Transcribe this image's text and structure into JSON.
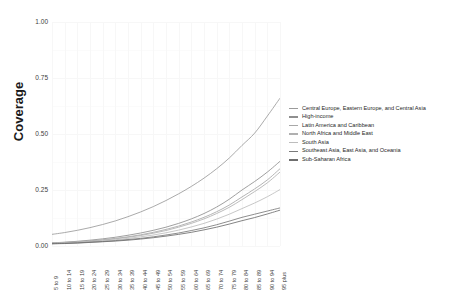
{
  "chart_data": {
    "type": "line",
    "title": "",
    "xlabel": "",
    "ylabel": "Coverage",
    "ylim": [
      0.0,
      1.0
    ],
    "yticks": [
      "1.00",
      "0.75",
      "0.50",
      "0.25",
      "0.00"
    ],
    "ytick_values": [
      1.0,
      0.75,
      0.5,
      0.25,
      0.0
    ],
    "grid": true,
    "legend_position": "right",
    "categories": [
      "5 to 9",
      "10 to 14",
      "15 to 19",
      "20 to 24",
      "25 to 29",
      "30 to 34",
      "35 to 39",
      "40 to 44",
      "45 to 49",
      "50 to 54",
      "55 to 59",
      "60 to 64",
      "65 to 69",
      "70 to 74",
      "75 to 79",
      "80 to 84",
      "85 to 89",
      "90 to 94",
      "95 plus"
    ],
    "series": [
      {
        "name": "Central Europe, Eastern Europe, and Central Asia",
        "color": "#9b9b9b",
        "values": [
          0.052,
          0.06,
          0.07,
          0.082,
          0.096,
          0.112,
          0.131,
          0.152,
          0.176,
          0.203,
          0.233,
          0.266,
          0.303,
          0.345,
          0.393,
          0.449,
          0.504,
          0.58,
          0.66
        ]
      },
      {
        "name": "High-income",
        "color": "#8f8f8f",
        "values": [
          0.014,
          0.017,
          0.021,
          0.026,
          0.032,
          0.039,
          0.048,
          0.058,
          0.07,
          0.084,
          0.101,
          0.121,
          0.145,
          0.174,
          0.209,
          0.25,
          0.288,
          0.33,
          0.378
        ]
      },
      {
        "name": "Latin America and Caribbean",
        "color": "#a8a8a8",
        "values": [
          0.013,
          0.016,
          0.019,
          0.023,
          0.028,
          0.034,
          0.041,
          0.05,
          0.061,
          0.074,
          0.089,
          0.107,
          0.128,
          0.153,
          0.183,
          0.219,
          0.255,
          0.295,
          0.345
        ]
      },
      {
        "name": "North Africa and Middle East",
        "color": "#b0b0b0",
        "values": [
          0.012,
          0.014,
          0.017,
          0.021,
          0.026,
          0.032,
          0.039,
          0.047,
          0.057,
          0.069,
          0.084,
          0.101,
          0.121,
          0.145,
          0.173,
          0.207,
          0.243,
          0.282,
          0.33
        ]
      },
      {
        "name": "South Asia",
        "color": "#bdbdbd",
        "values": [
          0.011,
          0.013,
          0.016,
          0.019,
          0.023,
          0.028,
          0.034,
          0.041,
          0.049,
          0.059,
          0.071,
          0.085,
          0.101,
          0.12,
          0.142,
          0.167,
          0.192,
          0.22,
          0.252
        ]
      },
      {
        "name": "Southeast Asia, East Asia, and Oceania",
        "color": "#7a7a7a",
        "values": [
          0.01,
          0.012,
          0.014,
          0.017,
          0.02,
          0.024,
          0.029,
          0.034,
          0.041,
          0.049,
          0.058,
          0.069,
          0.081,
          0.095,
          0.111,
          0.128,
          0.142,
          0.156,
          0.17
        ]
      },
      {
        "name": "Sub-Saharan Africa",
        "color": "#6e6e6e",
        "values": [
          0.01,
          0.011,
          0.013,
          0.016,
          0.019,
          0.022,
          0.026,
          0.031,
          0.037,
          0.044,
          0.052,
          0.061,
          0.072,
          0.084,
          0.098,
          0.113,
          0.127,
          0.143,
          0.16
        ]
      }
    ]
  },
  "axis": {
    "y_title": "Coverage"
  }
}
